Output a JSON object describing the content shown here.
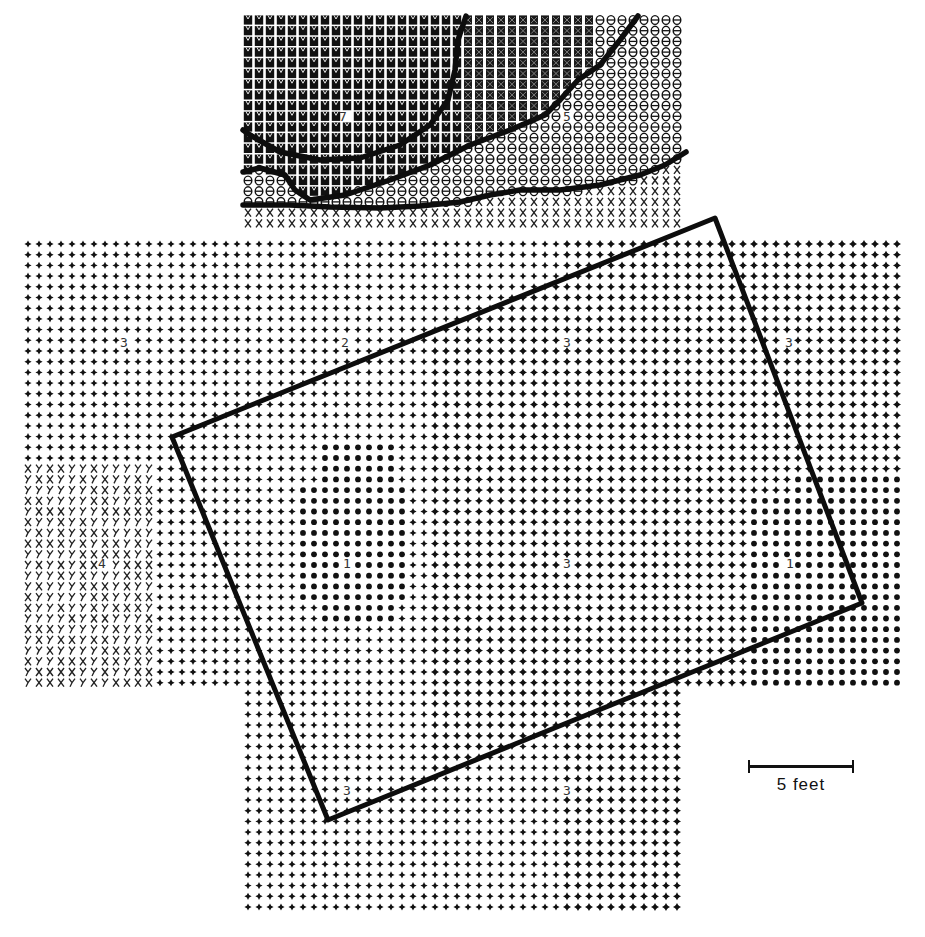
{
  "figure": {
    "ink_color": "#111111",
    "background": "#ffffff"
  },
  "grid": {
    "cell_w": 11.0,
    "cell_h": 10.7,
    "blocks": [
      {
        "name": "top-block",
        "x0": 248,
        "y0": 20,
        "cols": 40,
        "rows": 20
      },
      {
        "name": "middle-band",
        "x0": 28,
        "y0": 244,
        "cols": 80,
        "rows": 42
      },
      {
        "name": "bottom-block",
        "x0": 248,
        "y0": 693,
        "cols": 40,
        "rows": 21
      }
    ]
  },
  "symbols": {
    "legend_hint": [
      "dense-block",
      "theta",
      "X",
      "Y",
      "plus",
      "star",
      "dot"
    ],
    "regions": [
      {
        "name": "dense-top",
        "symbol": "dense-block"
      },
      {
        "name": "theta-top-right",
        "symbol": "theta"
      },
      {
        "name": "x-band-top",
        "symbol": "X"
      },
      {
        "name": "xy-left-patch",
        "symbol": "XY"
      },
      {
        "name": "plus-field",
        "symbol": "plus"
      },
      {
        "name": "star-field",
        "symbol": "star"
      },
      {
        "name": "dot-center",
        "symbol": "dot"
      },
      {
        "name": "dot-right",
        "symbol": "dot"
      }
    ]
  },
  "contour_labels": [
    {
      "text": "7",
      "x": 343,
      "y": 121
    },
    {
      "text": "5",
      "x": 567,
      "y": 121
    },
    {
      "text": "3",
      "x": 124,
      "y": 347
    },
    {
      "text": "2",
      "x": 345,
      "y": 347
    },
    {
      "text": "3",
      "x": 567,
      "y": 347
    },
    {
      "text": "3",
      "x": 789,
      "y": 347
    },
    {
      "text": "4",
      "x": 102,
      "y": 568
    },
    {
      "text": "1",
      "x": 347,
      "y": 568
    },
    {
      "text": "3",
      "x": 567,
      "y": 568
    },
    {
      "text": "1",
      "x": 790,
      "y": 568
    },
    {
      "text": "3",
      "x": 347,
      "y": 795
    },
    {
      "text": "3",
      "x": 567,
      "y": 795
    }
  ],
  "feature_outline": {
    "label": "rectangular-structure-outline",
    "corners": [
      [
        172,
        437
      ],
      [
        715,
        218
      ],
      [
        862,
        603
      ],
      [
        328,
        820
      ]
    ]
  },
  "contour_lines": [
    {
      "name": "contour-line-1",
      "points": [
        [
          466,
          16
        ],
        [
          458,
          40
        ],
        [
          455,
          70
        ],
        [
          448,
          100
        ],
        [
          430,
          125
        ],
        [
          400,
          145
        ],
        [
          360,
          158
        ],
        [
          320,
          160
        ],
        [
          280,
          152
        ],
        [
          250,
          135
        ],
        [
          243,
          130
        ]
      ]
    },
    {
      "name": "contour-line-2",
      "points": [
        [
          638,
          16
        ],
        [
          620,
          40
        ],
        [
          600,
          65
        ],
        [
          578,
          80
        ],
        [
          560,
          100
        ],
        [
          545,
          115
        ],
        [
          510,
          130
        ],
        [
          470,
          145
        ],
        [
          430,
          165
        ],
        [
          390,
          180
        ],
        [
          345,
          195
        ],
        [
          310,
          200
        ],
        [
          295,
          190
        ],
        [
          285,
          175
        ],
        [
          260,
          168
        ],
        [
          243,
          172
        ]
      ]
    },
    {
      "name": "contour-line-3",
      "points": [
        [
          686,
          152
        ],
        [
          665,
          165
        ],
        [
          640,
          175
        ],
        [
          600,
          185
        ],
        [
          560,
          190
        ],
        [
          520,
          190
        ],
        [
          490,
          195
        ],
        [
          460,
          202
        ],
        [
          420,
          206
        ],
        [
          380,
          208
        ],
        [
          330,
          207
        ],
        [
          290,
          205
        ],
        [
          243,
          205
        ]
      ]
    }
  ],
  "scale_bar": {
    "label": "5 feet",
    "length_px": 106
  }
}
